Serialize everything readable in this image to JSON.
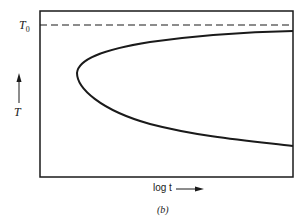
{
  "figure": {
    "caption": "(b)",
    "y_axis_label": "T",
    "x_axis_label": "log t",
    "reference_line": {
      "label_main": "T",
      "label_sub": "0",
      "style": "dashed"
    },
    "curve": "C-shaped transformation curve (nose pointing toward short times)",
    "colors": {
      "line": "#1a1a1a",
      "background": "#ffffff"
    }
  }
}
